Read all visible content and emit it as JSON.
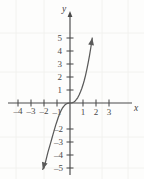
{
  "figure": {
    "background_color": "#fdfdfc",
    "curve_color": "#5a5a5a",
    "axis_color": "#4a4a4a",
    "grid_color": "#f0efed"
  },
  "axes": {
    "x_label": "x",
    "y_label": "y",
    "x_ticks": [
      {
        "value": -4,
        "label": "–4"
      },
      {
        "value": -3,
        "label": "–3"
      },
      {
        "value": -2,
        "label": "–2"
      },
      {
        "value": -1,
        "label": "–1"
      },
      {
        "value": 1,
        "label": "1"
      },
      {
        "value": 2,
        "label": "2"
      },
      {
        "value": 3,
        "label": "3"
      }
    ],
    "y_ticks": [
      {
        "value": 5,
        "label": "5"
      },
      {
        "value": 4,
        "label": "4"
      },
      {
        "value": 3,
        "label": "3"
      },
      {
        "value": 2,
        "label": "2"
      },
      {
        "value": 1,
        "label": "1"
      },
      {
        "value": -2,
        "label": "–2"
      },
      {
        "value": -3,
        "label": "–3"
      },
      {
        "value": -4,
        "label": "–4"
      },
      {
        "value": -5,
        "label": "–5"
      }
    ]
  },
  "chart_data": {
    "type": "line",
    "xlabel": "x",
    "ylabel": "y",
    "xlim": [
      -4.6,
      3.6
    ],
    "ylim": [
      -5.6,
      5.6
    ],
    "grid": false,
    "legend": null,
    "series": [
      {
        "name": "y = x³",
        "style": "solid",
        "color": "#5a5a5a",
        "arrow_start": true,
        "arrow_end": true,
        "x": [
          -2.1,
          -2.0,
          -1.9,
          -1.8,
          -1.7,
          -1.6,
          -1.5,
          -1.4,
          -1.3,
          -1.2,
          -1.1,
          -1.0,
          -0.9,
          -0.8,
          -0.7,
          -0.6,
          -0.5,
          -0.4,
          -0.3,
          -0.2,
          -0.1,
          0.0,
          0.1,
          0.2,
          0.3,
          0.4,
          0.5,
          0.6,
          0.7,
          0.8,
          0.9,
          1.0,
          1.1,
          1.2,
          1.3,
          1.4,
          1.5,
          1.6,
          1.7,
          1.71
        ],
        "y": [
          -5.1,
          -5.0,
          -4.6,
          -4.2,
          -3.8,
          -3.45,
          -3.1,
          -2.75,
          -2.4,
          -2.05,
          -1.7,
          -1.4,
          -1.1,
          -0.85,
          -0.62,
          -0.42,
          -0.28,
          -0.16,
          -0.08,
          -0.03,
          -0.01,
          0.0,
          0.01,
          0.03,
          0.08,
          0.16,
          0.28,
          0.42,
          0.62,
          0.85,
          1.1,
          1.4,
          1.75,
          2.15,
          2.6,
          3.1,
          3.65,
          4.25,
          4.9,
          5.0
        ]
      }
    ],
    "x_ticks": [
      -4,
      -3,
      -2,
      -1,
      1,
      2,
      3
    ],
    "y_ticks": [
      5,
      4,
      3,
      2,
      1,
      -2,
      -3,
      -4,
      -5
    ]
  }
}
